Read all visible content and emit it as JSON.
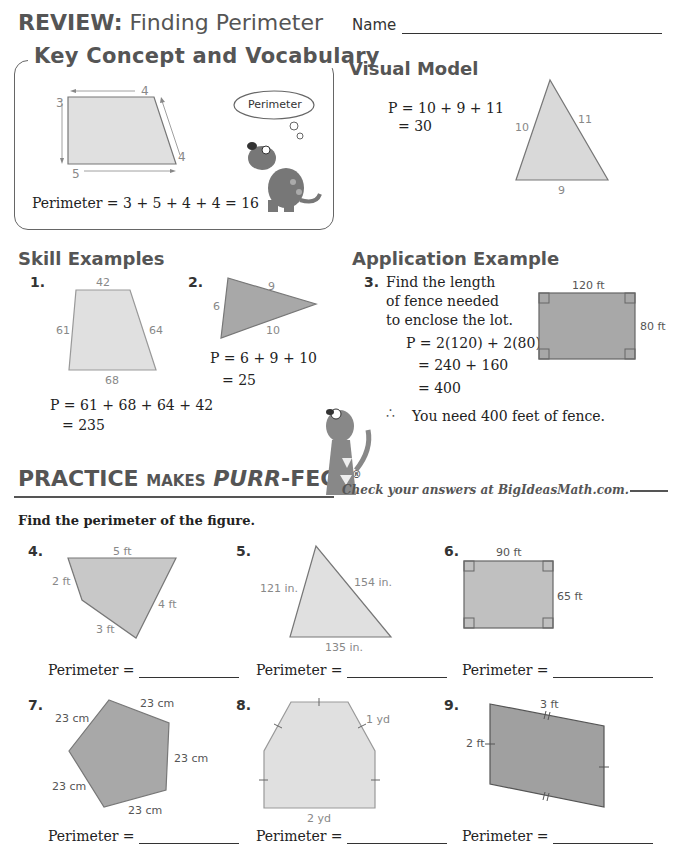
{
  "header": {
    "review_label": "REVIEW:",
    "topic": "Finding Perimeter",
    "name_label": "Name"
  },
  "key_concept": {
    "title": "Key Concept and Vocabulary",
    "figure_labels": {
      "top": "4",
      "left": "3",
      "right": "4",
      "bottom": "5"
    },
    "thought_bubble": "Perimeter",
    "equation": "Perimeter = 3 + 5 + 4 + 4 = 16"
  },
  "visual_model": {
    "title": "Visual Model",
    "line1": "P = 10 + 9 + 11",
    "line2": "= 30",
    "figure_labels": {
      "left": "10",
      "right": "11",
      "bottom": "9"
    }
  },
  "skill_examples": {
    "title": "Skill Examples",
    "items": [
      {
        "number": "1.",
        "labels": {
          "top": "42",
          "left": "61",
          "right": "64",
          "bottom": "68"
        },
        "line1": "P = 61 + 68 + 64 + 42",
        "line2": "= 235"
      },
      {
        "number": "2.",
        "labels": {
          "top": "9",
          "left": "6",
          "bottom": "10"
        },
        "line1": "P = 6 + 9 + 10",
        "line2": "= 25"
      }
    ]
  },
  "application": {
    "title": "Application Example",
    "number": "3.",
    "question_lines": [
      "Find the length",
      "of fence needed",
      "to enclose the lot."
    ],
    "work_lines": [
      "P = 2(120) + 2(80)",
      "= 240 + 160",
      "= 400"
    ],
    "conclusion_symbol": "∴",
    "conclusion": "You need 400 feet of fence.",
    "figure_labels": {
      "top": "120 ft",
      "right": "80 ft"
    }
  },
  "practice": {
    "title_word1": "PRACTICE",
    "title_word2": "MAKES",
    "title_word3": "PURR",
    "title_word4": "-FECT",
    "registered": "®",
    "check_text": "Check your answers at BigIdeasMath.com.",
    "instructions": "Find the perimeter of the figure.",
    "answer_label": "Perimeter =",
    "problems": [
      {
        "number": "4.",
        "labels": [
          "5 ft",
          "2 ft",
          "4 ft",
          "3 ft"
        ]
      },
      {
        "number": "5.",
        "labels": [
          "121 in.",
          "154 in.",
          "135 in."
        ]
      },
      {
        "number": "6.",
        "labels": [
          "90 ft",
          "65 ft"
        ]
      },
      {
        "number": "7.",
        "labels": [
          "23 cm",
          "23 cm",
          "23 cm",
          "23 cm",
          "23 cm"
        ]
      },
      {
        "number": "8.",
        "labels": [
          "1 yd",
          "2 yd"
        ]
      },
      {
        "number": "9.",
        "labels": [
          "3 ft",
          "2 ft"
        ]
      }
    ]
  },
  "colors": {
    "shape_light": "#d9d9d9",
    "shape_dark": "#a8a8a8",
    "stroke": "#777777",
    "heading": "#555555"
  }
}
